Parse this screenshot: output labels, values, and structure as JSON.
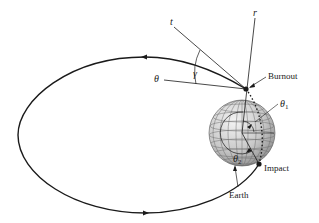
{
  "diagram": {
    "type": "ballistic-trajectory",
    "labels": {
      "tangent": "t",
      "radial": "r",
      "horizontal": "θ",
      "flight_path_angle": "γ",
      "burnout": "Burnout",
      "theta1": "θ",
      "theta1_sub": "1",
      "theta2": "θ",
      "theta2_sub": "2",
      "impact": "Impact",
      "earth": "Earth"
    },
    "colors": {
      "line": "#1a1a1a",
      "earth_light": "#f2f2f2",
      "earth_dark": "#9a9a9a",
      "grid": "#7a7a7a"
    }
  }
}
